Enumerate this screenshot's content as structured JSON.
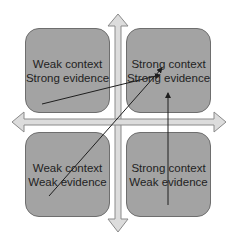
{
  "diagram": {
    "type": "quadrant-matrix",
    "colors": {
      "box_fill": "#a3a3a3",
      "box_border": "#6e6e6e",
      "axis_fill": "#dcdcdc",
      "axis_stroke": "#8a8a8a",
      "arrow_line": "#1e1e1e",
      "text": "#222222"
    },
    "quadrants": {
      "top_left": {
        "line1": "Weak context",
        "line2": "Strong evidence"
      },
      "top_right": {
        "line1": "Strong context",
        "line2": "Strong evidence"
      },
      "bottom_left": {
        "line1": "Weak context",
        "line2": "Weak evidence"
      },
      "bottom_right": {
        "line1": "Strong context",
        "line2": "Weak evidence"
      }
    },
    "axes": [
      {
        "name": "vertical-axis",
        "direction": "bidirectional",
        "icon": "double-arrow-vertical"
      },
      {
        "name": "horizontal-axis",
        "direction": "bidirectional",
        "icon": "double-arrow-horizontal"
      }
    ],
    "transitions": [
      {
        "from": "top_left",
        "to": "top_right",
        "style": "arrow"
      },
      {
        "from": "bottom_left",
        "to": "top_right",
        "style": "arrow"
      },
      {
        "from": "bottom_right",
        "to": "top_right",
        "style": "arrow"
      }
    ]
  }
}
